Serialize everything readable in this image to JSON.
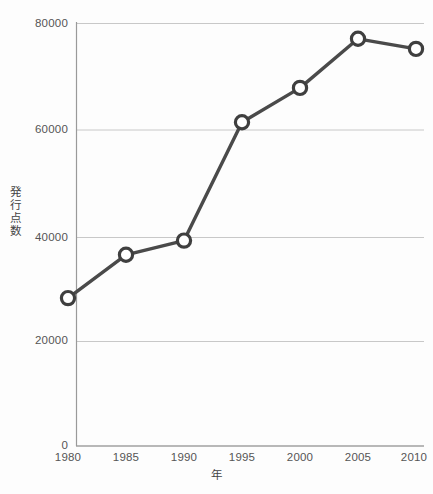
{
  "chart_data": {
    "type": "line",
    "title": "",
    "subtitle": "",
    "xlabel": "年",
    "ylabel": "発行点数",
    "x": [
      1980,
      1985,
      1990,
      1995,
      2000,
      2005,
      2010
    ],
    "categories": [
      "1980",
      "1985",
      "1990",
      "1995",
      "2000",
      "2005",
      "2010"
    ],
    "values": [
      28000,
      36200,
      38900,
      61300,
      67800,
      77100,
      75200
    ],
    "series": [
      {
        "name": "発行点数",
        "values": [
          28000,
          36200,
          38900,
          61300,
          67800,
          77100,
          75200
        ]
      }
    ],
    "xlim": [
      1980,
      2010
    ],
    "ylim": [
      0,
      80000
    ],
    "ytick_labels": [
      "0",
      "20000",
      "40000",
      "60000",
      "80000"
    ],
    "ytick_values": [
      0,
      20000,
      40000,
      60000,
      80000
    ],
    "xtick_labels": [
      "1980",
      "1985",
      "1990",
      "1995",
      "2000",
      "2005",
      "2010"
    ],
    "grid": "horizontal",
    "legend": "none",
    "marker": "open-circle",
    "line_color": "#4a4a4a",
    "marker_fill": "#ffffff",
    "marker_stroke": "#3f3f3f",
    "grid_color": "#c8c8c8",
    "axis_color": "#8a8a8a",
    "tick_label_color": "#555555",
    "background": "#fdfdfd"
  }
}
